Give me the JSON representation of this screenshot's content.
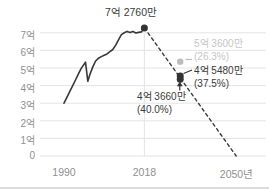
{
  "chart_data": {
    "type": "line",
    "title": "",
    "y_ticks": [
      "7억",
      "6억",
      "5억",
      "4억",
      "3억",
      "2억",
      "1억",
      "0"
    ],
    "y_tick_values": [
      7,
      6,
      5,
      4,
      3,
      2,
      1,
      0
    ],
    "x_ticks": [
      "1990",
      "2018",
      "2050년"
    ],
    "x_tick_values": [
      1990,
      2018,
      2050
    ],
    "ylim": [
      0,
      7.6
    ],
    "xlim": [
      1982,
      2061
    ],
    "grid": true,
    "series": [
      {
        "name": "historical",
        "style": "solid",
        "points": [
          [
            1990,
            3.0
          ],
          [
            1991,
            3.33
          ],
          [
            1992,
            3.66
          ],
          [
            1993,
            3.99
          ],
          [
            1994,
            4.32
          ],
          [
            1995,
            4.65
          ],
          [
            1996,
            4.98
          ],
          [
            1997.5,
            5.33
          ],
          [
            1998.3,
            4.25
          ],
          [
            1999,
            4.62
          ],
          [
            2000,
            5.05
          ],
          [
            2001,
            5.4
          ],
          [
            2002,
            5.55
          ],
          [
            2003,
            5.65
          ],
          [
            2004,
            5.73
          ],
          [
            2005,
            5.8
          ],
          [
            2006,
            5.93
          ],
          [
            2007,
            6.05
          ],
          [
            2008,
            6.3
          ],
          [
            2009,
            6.6
          ],
          [
            2010,
            6.9
          ],
          [
            2011,
            7.0
          ],
          [
            2012,
            7.08
          ],
          [
            2013,
            7.02
          ],
          [
            2014,
            7.08
          ],
          [
            2015,
            6.99
          ],
          [
            2016,
            7.02
          ],
          [
            2017,
            7.05
          ],
          [
            2018,
            7.276
          ]
        ]
      },
      {
        "name": "projection",
        "style": "dashed",
        "points": [
          [
            2018,
            7.276
          ],
          [
            2050,
            0
          ]
        ]
      }
    ],
    "annotations": [
      {
        "id": "peak",
        "label": "7억 2760만",
        "sublabel": "",
        "x": 2018,
        "y": 7.276,
        "tone": "dark"
      },
      {
        "id": "scenario-high",
        "label": "5억 3600만",
        "sublabel": "(26.3%)",
        "x": 2030.5,
        "y": 5.36,
        "tone": "gray"
      },
      {
        "id": "scenario-mid",
        "label": "4억 5480만",
        "sublabel": "(37.5%)",
        "x": 2030.5,
        "y": 4.548,
        "tone": "dark"
      },
      {
        "id": "scenario-low",
        "label": "4억 3660만",
        "sublabel": "(40.0%)",
        "x": 2030.5,
        "y": 4.366,
        "tone": "dark"
      }
    ],
    "colors": {
      "line": "#383838",
      "projection": "#3b3b3b",
      "gray_text": "#c6c6c6",
      "gray_dot": "#bcbcbc",
      "dark_dot": "#333333",
      "grid": "#e4e4e4",
      "axis_text": "#909090",
      "dark_text": "#3b3b3b",
      "page_line": "#dcdcdc",
      "background": "#ffffff"
    }
  }
}
